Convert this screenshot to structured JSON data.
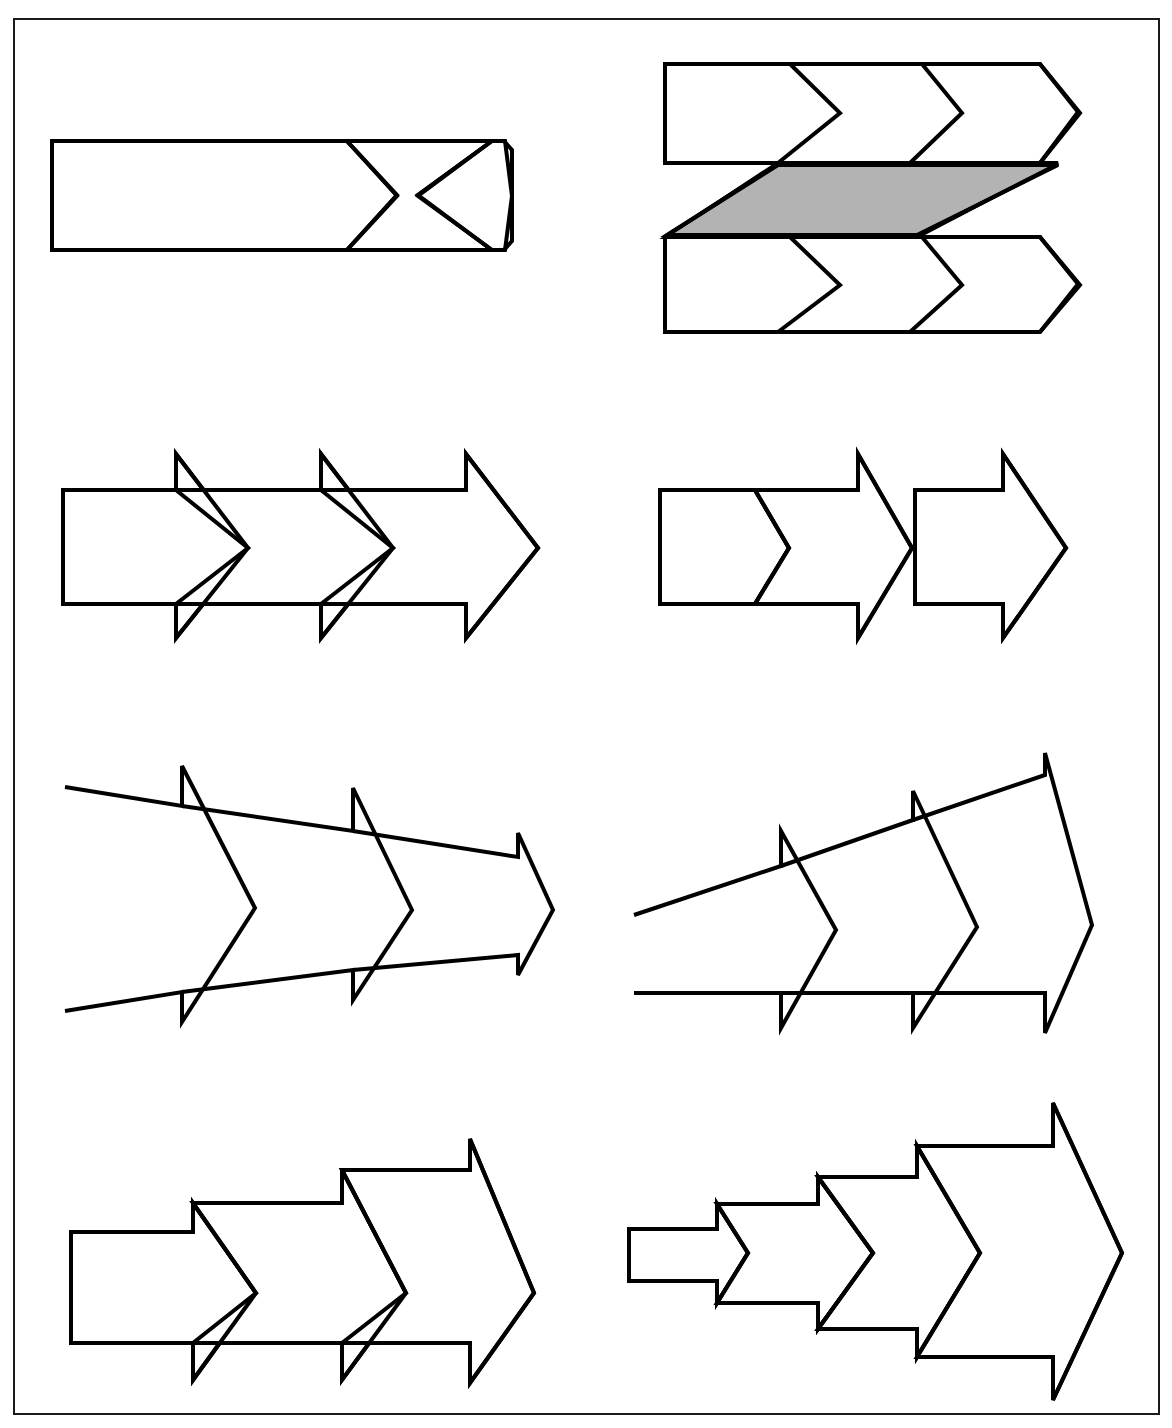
{
  "page": {
    "width": 1172,
    "height": 1428,
    "background_color": "#ffffff",
    "border_color": "#1a1a1a",
    "line_color": "#000000",
    "shaded_fill_color": "#b3b3b3",
    "figure_count": 8,
    "rows": 4,
    "columns": 2
  },
  "figures": [
    {
      "id": "figure-1",
      "name": "chevron-band-three-segment",
      "row": 1,
      "column": 1,
      "description": "Horizontal band divided into three chevron segments, flat top and bottom, pointed right end",
      "segments": 3,
      "shaded": false,
      "taper": "none",
      "barbs": false
    },
    {
      "id": "figure-2",
      "name": "z-pattern-twin-chevron-bands-with-shaded-connector",
      "row": 1,
      "column": 2,
      "description": "Two horizontal chevron bands, upper and lower, joined by a shaded diagonal parallelogram connector forming a Z",
      "segments": 3,
      "shaded": true,
      "taper": "none",
      "barbs": false,
      "shaded_part": "diagonal-parallelogram-connector"
    },
    {
      "id": "figure-3",
      "name": "barbed-arrow-chain-uniform",
      "row": 2,
      "column": 1,
      "description": "Three overlapping barbed arrowheads of uniform width in a straight horizontal chain",
      "segments": 3,
      "shaded": false,
      "taper": "none",
      "barbs": true
    },
    {
      "id": "figure-4",
      "name": "chevron-then-barbed-arrows-detached",
      "row": 2,
      "column": 2,
      "description": "A plain chevron band segment followed by a barbed arrow, then a detached second barbed arrow",
      "segments": 3,
      "shaded": false,
      "taper": "none",
      "barbs": true,
      "detached": true
    },
    {
      "id": "figure-5",
      "name": "converging-barbed-arrow-chain",
      "row": 3,
      "column": 1,
      "description": "Three barbed arrowheads decreasing in width left to right, open unterminated tails converging toward the tip",
      "segments": 3,
      "shaded": false,
      "taper": "converging",
      "barbs": true,
      "open_tail": true
    },
    {
      "id": "figure-6",
      "name": "diverging-rising-barbed-arrow-chain",
      "row": 3,
      "column": 2,
      "description": "Three barbed arrowheads increasing in height left to right with a flat bottom edge and a rising top edge",
      "segments": 3,
      "shaded": false,
      "taper": "diverging-upward",
      "barbs": true,
      "open_tail": true
    },
    {
      "id": "figure-7",
      "name": "stepped-upward-barbed-arrow-chain",
      "row": 4,
      "column": 1,
      "description": "Three barbed arrowheads growing in discrete steps upward, flat bottom edge, stepped top edge",
      "segments": 3,
      "shaded": false,
      "taper": "stepped-upward",
      "barbs": true
    },
    {
      "id": "figure-8",
      "name": "symmetric-nested-growing-arrow-chain",
      "row": 4,
      "column": 2,
      "description": "Four symmetrically nested arrowheads growing progressively larger left to right from a narrow stem",
      "segments": 4,
      "shaded": false,
      "taper": "symmetric-growing",
      "barbs": true
    }
  ],
  "legend": {
    "line_style": "solid black outline",
    "fill_style": "white with one gray shaded region",
    "sheet_style": "single rectangular border frame"
  }
}
